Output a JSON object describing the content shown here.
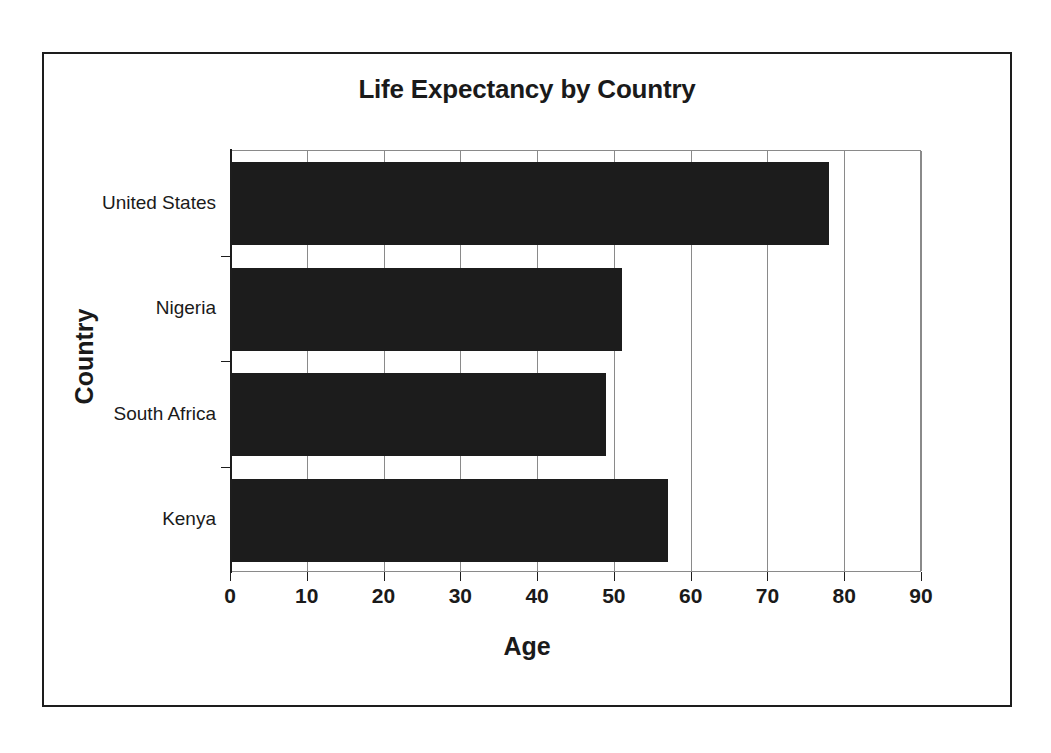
{
  "chart_data": {
    "type": "bar",
    "orientation": "horizontal",
    "title": "Life Expectancy by Country",
    "xlabel": "Age",
    "ylabel": "Country",
    "categories": [
      "United States",
      "Nigeria",
      "South Africa",
      "Kenya"
    ],
    "values": [
      78,
      51,
      49,
      57
    ],
    "series": [
      {
        "name": "Life Expectancy",
        "values": [
          78,
          51,
          49,
          57
        ]
      }
    ],
    "xlim": [
      0,
      90
    ],
    "xticks": [
      0,
      10,
      20,
      30,
      40,
      50,
      60,
      70,
      80,
      90
    ],
    "xtick_labels": [
      "0",
      "10",
      "20",
      "30",
      "40",
      "50",
      "60",
      "70",
      "80",
      "90"
    ],
    "grid": true,
    "grid_axis": "x",
    "legend": false,
    "legend_position": "none",
    "bar_color": "#1c1c1c",
    "plot_background": "#ffffff",
    "frame_border_color": "#1d1d1d",
    "gridline_color": "#8a8a8a",
    "points": [
      {
        "category": "United States",
        "value": 78
      },
      {
        "category": "Nigeria",
        "value": 51
      },
      {
        "category": "South Africa",
        "value": 49
      },
      {
        "category": "Kenya",
        "value": 57
      }
    ]
  },
  "top_caption": ""
}
